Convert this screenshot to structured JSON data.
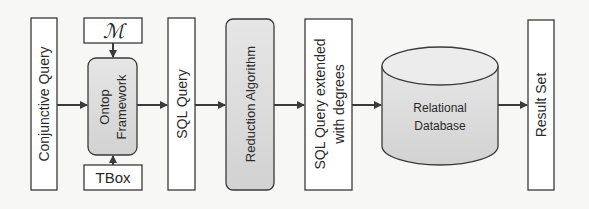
{
  "diagram": {
    "nodes": [
      {
        "id": "conjunctive-query",
        "label": "Conjunctive Query",
        "shape": "rect"
      },
      {
        "id": "mapping",
        "label": "ℳ",
        "shape": "rect"
      },
      {
        "id": "ontop-framework",
        "label_line1": "Ontop",
        "label_line2": "Framework",
        "shape": "rounded-rect"
      },
      {
        "id": "tbox",
        "label": "TBox",
        "shape": "rect"
      },
      {
        "id": "sql-query",
        "label": "SQL Query",
        "shape": "rect"
      },
      {
        "id": "reduction-algorithm",
        "label": "Reduction Algorithm",
        "shape": "rounded-rect"
      },
      {
        "id": "sql-query-extended",
        "label_line1": "SQL Query extended",
        "label_line2": "with degrees",
        "shape": "rect"
      },
      {
        "id": "relational-database",
        "label_line1": "Relational",
        "label_line2": "Database",
        "shape": "cylinder"
      },
      {
        "id": "result-set",
        "label": "Result Set",
        "shape": "rect"
      }
    ],
    "edges": [
      {
        "from": "conjunctive-query",
        "to": "ontop-framework"
      },
      {
        "from": "mapping",
        "to": "ontop-framework"
      },
      {
        "from": "tbox",
        "to": "ontop-framework"
      },
      {
        "from": "ontop-framework",
        "to": "sql-query"
      },
      {
        "from": "sql-query",
        "to": "reduction-algorithm"
      },
      {
        "from": "reduction-algorithm",
        "to": "sql-query-extended"
      },
      {
        "from": "sql-query-extended",
        "to": "relational-database"
      },
      {
        "from": "relational-database",
        "to": "result-set"
      }
    ],
    "colors": {
      "stroke": "#3a3a3a",
      "box_fill": "#ffffff",
      "process_fill": "#dcdcdc",
      "background": "#f7f7f5"
    }
  }
}
